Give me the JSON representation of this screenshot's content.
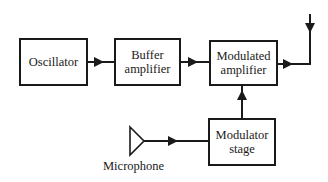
{
  "diagram": {
    "type": "block-diagram",
    "blocks": [
      {
        "id": "oscillator",
        "label": "Oscillator"
      },
      {
        "id": "buffer",
        "label": "Buffer\namplifier"
      },
      {
        "id": "modulated",
        "label": "Modulated\namplifier"
      },
      {
        "id": "modulator",
        "label": "Modulator\nstage"
      }
    ],
    "source": {
      "id": "microphone",
      "label": "Microphone",
      "shape": "triangle"
    },
    "connections": [
      {
        "from": "oscillator",
        "to": "buffer"
      },
      {
        "from": "buffer",
        "to": "modulated"
      },
      {
        "from": "modulated",
        "to": "output"
      },
      {
        "from": "microphone",
        "to": "modulator"
      },
      {
        "from": "modulator",
        "to": "modulated"
      }
    ],
    "colors": {
      "line": "#1a1a1a",
      "background": "#ffffff"
    }
  }
}
